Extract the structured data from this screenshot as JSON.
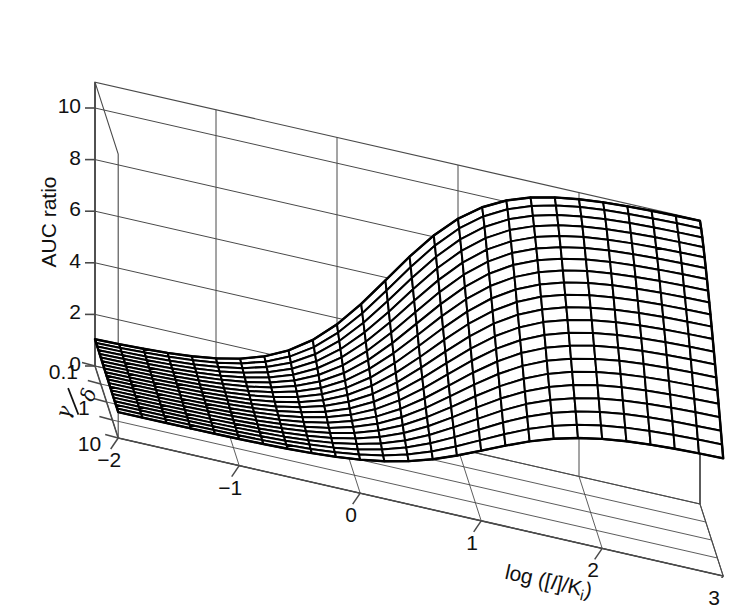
{
  "figure": {
    "kind": "3d-mesh-surface",
    "background": "#ffffff",
    "line_color": "#000000",
    "axis_color": "#4a4a4a"
  },
  "axes": {
    "z": {
      "title": "AUC ratio",
      "ticks": [
        "0",
        "2",
        "4",
        "6",
        "8",
        "10"
      ],
      "values": [
        0,
        2,
        4,
        6,
        8,
        10
      ],
      "range": [
        0,
        11
      ]
    },
    "x": {
      "title_parts": {
        "pre": "log ([",
        "ital": "I",
        "mid": "]/K",
        "sub": "i",
        "post": ")"
      },
      "title_plain": "log ([I]/Ki)",
      "ticks": [
        "−2",
        "−1",
        "0",
        "1",
        "2",
        "3"
      ],
      "values": [
        -2,
        -1,
        0,
        1,
        2,
        3
      ],
      "range": [
        -2,
        3
      ]
    },
    "y": {
      "title_parts": {
        "num": "γ",
        "den": "δ"
      },
      "title_plain": "γ/δ",
      "ticks": [
        "0.1",
        "1",
        "10"
      ],
      "values": [
        0.1,
        1,
        10
      ],
      "log_range": [
        -1,
        1
      ]
    }
  },
  "chart_data": {
    "type": "surface",
    "title": "",
    "xlabel": "log ([I]/Ki)",
    "ylabel": "γ/δ",
    "zlabel": "AUC ratio",
    "xlim": [
      -2,
      3
    ],
    "ylim_log10": [
      -1,
      1
    ],
    "zlim": [
      0,
      11
    ],
    "grid": true,
    "legend": null,
    "mesh": {
      "nx": 26,
      "ny": 21
    },
    "model": {
      "description": "AUC ratio = 1 + (Rmax-1)/(1+10^(-(x-x50(y)))) ; plateau Rmax depends on gamma/delta",
      "baseline": 1.0,
      "plateau_min": 1.0,
      "plateau_max": 11.0,
      "hill": 1.0
    },
    "x": [
      -2,
      -1.8,
      -1.6,
      -1.4,
      -1.2,
      -1,
      -0.8,
      -0.6,
      -0.4,
      -0.2,
      0,
      0.2,
      0.4,
      0.6,
      0.8,
      1,
      1.2,
      1.4,
      1.6,
      1.8,
      2,
      2.2,
      2.4,
      2.6,
      2.8,
      3
    ],
    "y_log10": [
      -1,
      -0.9,
      -0.8,
      -0.7,
      -0.6,
      -0.5,
      -0.4,
      -0.3,
      -0.2,
      -0.1,
      0,
      0.1,
      0.2,
      0.3,
      0.4,
      0.5,
      0.6,
      0.7,
      0.8,
      0.9,
      1
    ],
    "z_series": [
      {
        "name": "gamma/delta = 0.1",
        "y_log10": -1,
        "values": [
          1.0,
          1.0,
          1.0,
          1.1,
          1.1,
          1.2,
          1.3,
          1.5,
          1.8,
          2.3,
          3.1,
          4.3,
          5.8,
          7.3,
          8.6,
          9.5,
          10.1,
          10.5,
          10.7,
          10.8,
          10.9,
          11.0,
          11.0,
          11.0,
          11.0,
          11.0
        ]
      },
      {
        "name": "gamma/delta = 0.32",
        "y_log10": -0.5,
        "values": [
          1.0,
          1.0,
          1.0,
          1.1,
          1.1,
          1.2,
          1.3,
          1.5,
          1.8,
          2.3,
          3.1,
          4.3,
          5.8,
          7.2,
          8.4,
          9.3,
          9.9,
          10.2,
          10.4,
          10.5,
          10.6,
          10.6,
          10.6,
          10.6,
          10.6,
          10.6
        ]
      },
      {
        "name": "gamma/delta = 1",
        "y_log10": 0,
        "values": [
          1.0,
          1.0,
          1.0,
          1.0,
          1.1,
          1.1,
          1.2,
          1.4,
          1.7,
          2.1,
          2.8,
          3.8,
          5.1,
          6.4,
          7.5,
          8.3,
          8.8,
          9.1,
          9.3,
          9.4,
          9.4,
          9.5,
          9.5,
          9.5,
          9.5,
          9.5
        ]
      },
      {
        "name": "gamma/delta = 3.2",
        "y_log10": 0.5,
        "values": [
          1.0,
          1.0,
          1.0,
          1.0,
          1.0,
          1.1,
          1.1,
          1.2,
          1.4,
          1.7,
          2.2,
          2.9,
          3.8,
          4.8,
          5.7,
          6.4,
          6.8,
          7.1,
          7.3,
          7.4,
          7.4,
          7.5,
          7.5,
          7.5,
          7.5,
          7.5
        ]
      },
      {
        "name": "gamma/delta = 10",
        "y_log10": 1,
        "values": [
          1.0,
          1.0,
          1.0,
          1.0,
          1.0,
          1.0,
          1.1,
          1.1,
          1.2,
          1.4,
          1.7,
          2.1,
          2.6,
          3.2,
          3.7,
          4.1,
          4.4,
          4.6,
          4.7,
          4.8,
          4.8,
          4.8,
          4.8,
          4.8,
          4.8,
          4.8
        ]
      }
    ]
  }
}
